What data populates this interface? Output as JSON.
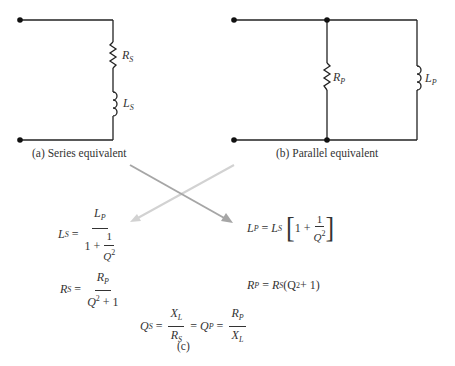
{
  "series_circuit": {
    "caption": "(a) Series equivalent",
    "resistor_label": "R",
    "resistor_sub": "S",
    "inductor_label": "L",
    "inductor_sub": "S"
  },
  "parallel_circuit": {
    "caption": "(b) Parallel equivalent",
    "resistor_label": "R",
    "resistor_sub": "P",
    "inductor_label": "L",
    "inductor_sub": "P"
  },
  "arrows": {
    "series_to_parallel_color": "#a0a0a0",
    "parallel_to_series_color": "#d0d0d0"
  },
  "equations": {
    "ls": {
      "lhs": "L",
      "lhs_sub": "S",
      "eq": "=",
      "num": "L",
      "num_sub": "P",
      "den_one": "1",
      "den_plus": "+",
      "inner_num": "1",
      "inner_den": "Q",
      "inner_den_sup": "2"
    },
    "lp": {
      "lhs": "L",
      "lhs_sub": "P",
      "eq": "=",
      "rhs": "L",
      "rhs_sub": "S",
      "lbracket": "[",
      "one": "1",
      "plus": "+",
      "inner_num": "1",
      "inner_den": "Q",
      "inner_den_sup": "2",
      "rbracket": "]"
    },
    "rs": {
      "lhs": "R",
      "lhs_sub": "S",
      "eq": "=",
      "num": "R",
      "num_sub": "P",
      "den": "Q",
      "den_sup": "2",
      "den_rest": " + 1"
    },
    "rp": {
      "lhs": "R",
      "lhs_sub": "P",
      "eq": "=",
      "rhs": "R",
      "rhs_sub": "S",
      "paren_open": " (Q",
      "paren_sup": "2",
      "paren_rest": " + 1)"
    },
    "q": {
      "qs": "Q",
      "qs_sub": "S",
      "eq1": "=",
      "n1": "X",
      "n1_sub": "L",
      "d1": "R",
      "d1_sub": "S",
      "eq2": "=",
      "qp": "Q",
      "qp_sub": "P",
      "eq3": "=",
      "n2": "R",
      "n2_sub": "P",
      "d2": "X",
      "d2_sub": "L"
    }
  },
  "caption_c": "(c)"
}
